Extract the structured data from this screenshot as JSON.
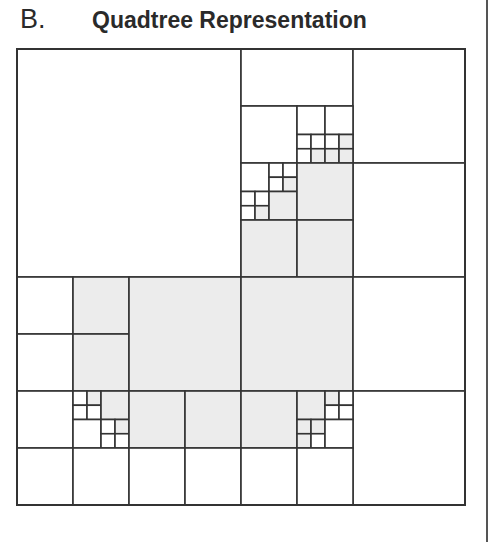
{
  "figure": {
    "panel_label": "B.",
    "title": "Quadtree Representation",
    "colors": {
      "stroke": "#333333",
      "filled": "#ececec",
      "empty": "#ffffff"
    },
    "grid": {
      "origin_x": 17,
      "origin_y": 49,
      "unit_x": 56,
      "unit_y": 57,
      "size": 8
    },
    "cells": [
      {
        "x": 0,
        "y": 0,
        "w": 4,
        "h": 4,
        "filled": false
      },
      {
        "x": 4,
        "y": 0,
        "w": 2,
        "h": 1,
        "filled": false
      },
      {
        "x": 6,
        "y": 0,
        "w": 2,
        "h": 2,
        "filled": false
      },
      {
        "x": 6,
        "y": 2,
        "w": 2,
        "h": 2,
        "filled": false
      },
      {
        "x": 4,
        "y": 1,
        "w": 1,
        "h": 1,
        "filled": false
      },
      {
        "x": 5,
        "y": 1,
        "w": 0.5,
        "h": 0.5,
        "filled": false
      },
      {
        "x": 5.5,
        "y": 1,
        "w": 0.5,
        "h": 0.5,
        "filled": false
      },
      {
        "x": 5,
        "y": 1.5,
        "w": 0.25,
        "h": 0.25,
        "filled": false
      },
      {
        "x": 5.25,
        "y": 1.5,
        "w": 0.25,
        "h": 0.25,
        "filled": false
      },
      {
        "x": 5.5,
        "y": 1.5,
        "w": 0.25,
        "h": 0.25,
        "filled": false
      },
      {
        "x": 5.75,
        "y": 1.5,
        "w": 0.25,
        "h": 0.25,
        "filled": true
      },
      {
        "x": 5,
        "y": 1.75,
        "w": 0.25,
        "h": 0.25,
        "filled": false
      },
      {
        "x": 5.25,
        "y": 1.75,
        "w": 0.25,
        "h": 0.25,
        "filled": true
      },
      {
        "x": 5.5,
        "y": 1.75,
        "w": 0.25,
        "h": 0.25,
        "filled": true
      },
      {
        "x": 5.75,
        "y": 1.75,
        "w": 0.25,
        "h": 0.25,
        "filled": true
      },
      {
        "x": 4,
        "y": 2,
        "w": 0.5,
        "h": 0.5,
        "filled": false
      },
      {
        "x": 4.5,
        "y": 2,
        "w": 0.25,
        "h": 0.25,
        "filled": false
      },
      {
        "x": 4.75,
        "y": 2,
        "w": 0.25,
        "h": 0.25,
        "filled": false
      },
      {
        "x": 4.5,
        "y": 2.25,
        "w": 0.25,
        "h": 0.25,
        "filled": false
      },
      {
        "x": 4.75,
        "y": 2.25,
        "w": 0.25,
        "h": 0.25,
        "filled": true
      },
      {
        "x": 4,
        "y": 2.5,
        "w": 0.25,
        "h": 0.25,
        "filled": false
      },
      {
        "x": 4.25,
        "y": 2.5,
        "w": 0.25,
        "h": 0.25,
        "filled": false
      },
      {
        "x": 4,
        "y": 2.75,
        "w": 0.25,
        "h": 0.25,
        "filled": false
      },
      {
        "x": 4.25,
        "y": 2.75,
        "w": 0.25,
        "h": 0.25,
        "filled": true
      },
      {
        "x": 4.5,
        "y": 2.5,
        "w": 0.5,
        "h": 0.5,
        "filled": true
      },
      {
        "x": 5,
        "y": 2,
        "w": 1,
        "h": 1,
        "filled": true
      },
      {
        "x": 4,
        "y": 3,
        "w": 1,
        "h": 1,
        "filled": true
      },
      {
        "x": 5,
        "y": 3,
        "w": 1,
        "h": 1,
        "filled": true
      },
      {
        "x": 0,
        "y": 4,
        "w": 1,
        "h": 1,
        "filled": false
      },
      {
        "x": 1,
        "y": 4,
        "w": 1,
        "h": 1,
        "filled": true
      },
      {
        "x": 0,
        "y": 5,
        "w": 1,
        "h": 1,
        "filled": false
      },
      {
        "x": 1,
        "y": 5,
        "w": 1,
        "h": 1,
        "filled": true
      },
      {
        "x": 2,
        "y": 4,
        "w": 2,
        "h": 2,
        "filled": true
      },
      {
        "x": 4,
        "y": 4,
        "w": 2,
        "h": 2,
        "filled": true
      },
      {
        "x": 6,
        "y": 4,
        "w": 2,
        "h": 2,
        "filled": false
      },
      {
        "x": 6,
        "y": 6,
        "w": 2,
        "h": 2,
        "filled": false
      },
      {
        "x": 0,
        "y": 6,
        "w": 1,
        "h": 1,
        "filled": false
      },
      {
        "x": 1,
        "y": 6,
        "w": 0.25,
        "h": 0.25,
        "filled": false
      },
      {
        "x": 1.25,
        "y": 6,
        "w": 0.25,
        "h": 0.25,
        "filled": true
      },
      {
        "x": 1,
        "y": 6.25,
        "w": 0.25,
        "h": 0.25,
        "filled": false
      },
      {
        "x": 1.25,
        "y": 6.25,
        "w": 0.25,
        "h": 0.25,
        "filled": false
      },
      {
        "x": 1.5,
        "y": 6,
        "w": 0.5,
        "h": 0.5,
        "filled": true
      },
      {
        "x": 1,
        "y": 6.5,
        "w": 0.5,
        "h": 0.5,
        "filled": false
      },
      {
        "x": 1.5,
        "y": 6.5,
        "w": 0.25,
        "h": 0.25,
        "filled": false
      },
      {
        "x": 1.75,
        "y": 6.5,
        "w": 0.25,
        "h": 0.25,
        "filled": true
      },
      {
        "x": 1.5,
        "y": 6.75,
        "w": 0.25,
        "h": 0.25,
        "filled": false
      },
      {
        "x": 1.75,
        "y": 6.75,
        "w": 0.25,
        "h": 0.25,
        "filled": false
      },
      {
        "x": 2,
        "y": 6,
        "w": 1,
        "h": 1,
        "filled": true
      },
      {
        "x": 3,
        "y": 6,
        "w": 1,
        "h": 1,
        "filled": true
      },
      {
        "x": 4,
        "y": 6,
        "w": 1,
        "h": 1,
        "filled": true
      },
      {
        "x": 5,
        "y": 6,
        "w": 0.5,
        "h": 0.5,
        "filled": true
      },
      {
        "x": 5.5,
        "y": 6,
        "w": 0.25,
        "h": 0.25,
        "filled": true
      },
      {
        "x": 5.75,
        "y": 6,
        "w": 0.25,
        "h": 0.25,
        "filled": false
      },
      {
        "x": 5.5,
        "y": 6.25,
        "w": 0.25,
        "h": 0.25,
        "filled": false
      },
      {
        "x": 5.75,
        "y": 6.25,
        "w": 0.25,
        "h": 0.25,
        "filled": false
      },
      {
        "x": 5,
        "y": 6.5,
        "w": 0.25,
        "h": 0.25,
        "filled": true
      },
      {
        "x": 5.25,
        "y": 6.5,
        "w": 0.25,
        "h": 0.25,
        "filled": true
      },
      {
        "x": 5,
        "y": 6.75,
        "w": 0.25,
        "h": 0.25,
        "filled": true
      },
      {
        "x": 5.25,
        "y": 6.75,
        "w": 0.25,
        "h": 0.25,
        "filled": false
      },
      {
        "x": 5.5,
        "y": 6.5,
        "w": 0.5,
        "h": 0.5,
        "filled": false
      },
      {
        "x": 0,
        "y": 7,
        "w": 1,
        "h": 1,
        "filled": false
      },
      {
        "x": 1,
        "y": 7,
        "w": 1,
        "h": 1,
        "filled": false
      },
      {
        "x": 2,
        "y": 7,
        "w": 1,
        "h": 1,
        "filled": false
      },
      {
        "x": 3,
        "y": 7,
        "w": 1,
        "h": 1,
        "filled": false
      },
      {
        "x": 4,
        "y": 7,
        "w": 1,
        "h": 1,
        "filled": false
      },
      {
        "x": 5,
        "y": 7,
        "w": 1,
        "h": 1,
        "filled": false
      }
    ]
  }
}
